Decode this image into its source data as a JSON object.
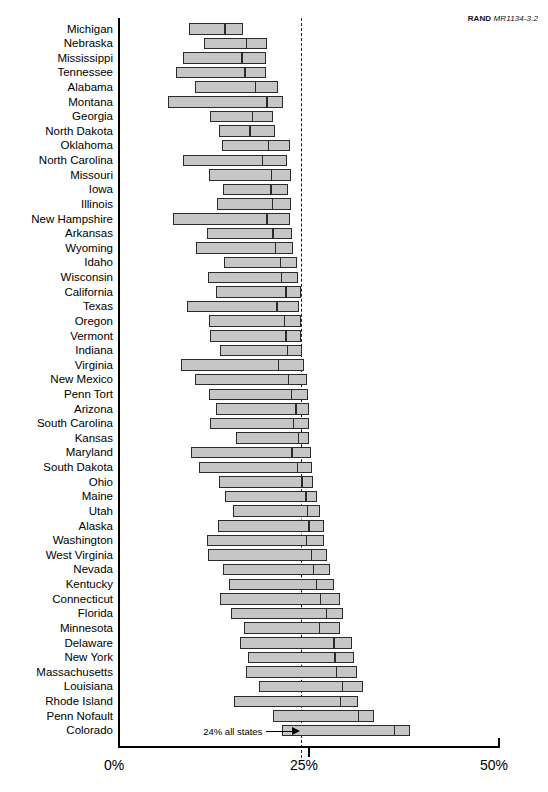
{
  "source_note": {
    "brand": "RAND",
    "report_id": "MR1134-3.2"
  },
  "annotation": {
    "label": "24% all states",
    "value": 24,
    "arrow_icon": "right-arrow-icon"
  },
  "axis": {
    "ticks": [
      "0%",
      "25%",
      "50%"
    ],
    "tick_values": [
      0,
      25,
      50
    ],
    "min": 0,
    "max": 50
  },
  "chart_data": {
    "type": "bar",
    "subtype": "floating-range-bar",
    "title": "",
    "subtitle": "",
    "xlabel": "",
    "ylabel": "",
    "xlim": [
      0,
      50
    ],
    "grid": false,
    "legend": null,
    "reference_line": {
      "value": 24,
      "label": "24% all states",
      "style": "dashed"
    },
    "note": "Each bar spans a low-to-high range; the internal divider marks the point estimate.",
    "categories": [
      "Michigan",
      "Nebraska",
      "Mississippi",
      "Tennessee",
      "Alabama",
      "Montana",
      "Georgia",
      "North Dakota",
      "Oklahoma",
      "North Carolina",
      "Missouri",
      "Iowa",
      "Illinois",
      "New Hampshire",
      "Arkansas",
      "Wyoming",
      "Idaho",
      "Wisconsin",
      "California",
      "Texas",
      "Oregon",
      "Vermont",
      "Indiana",
      "Virginia",
      "New Mexico",
      "Penn Tort",
      "Arizona",
      "South Carolina",
      "Kansas",
      "Maryland",
      "South Dakota",
      "Ohio",
      "Maine",
      "Utah",
      "Alaska",
      "Washington",
      "West Virginia",
      "Nevada",
      "Kentucky",
      "Connecticut",
      "Florida",
      "Minnesota",
      "Delaware",
      "New York",
      "Massachusetts",
      "Louisiana",
      "Rhode Island",
      "Penn Nofault",
      "Colorado"
    ],
    "series": [
      {
        "name": "low",
        "values": [
          9.3,
          11.2,
          8.5,
          7.6,
          10.1,
          6.5,
          12.1,
          13.2,
          13.6,
          8.5,
          11.9,
          13.8,
          13.0,
          7.2,
          11.6,
          10.2,
          13.9,
          11.8,
          12.8,
          9.0,
          11.9,
          12.0,
          13.4,
          8.3,
          10.1,
          11.9,
          12.8,
          12.1,
          15.4,
          9.5,
          10.6,
          13.2,
          14.0,
          15.0,
          13.1,
          11.6,
          11.8,
          13.8,
          14.5,
          13.3,
          14.8,
          16.5,
          16.0,
          17.0,
          16.7,
          18.5,
          15.2,
          20.3,
          21.5
        ]
      },
      {
        "name": "point",
        "values": [
          14.0,
          16.8,
          16.2,
          16.6,
          18.0,
          19.5,
          17.6,
          17.3,
          19.7,
          18.9,
          20.1,
          20.0,
          20.2,
          19.5,
          20.3,
          20.6,
          21.3,
          21.4,
          22.0,
          20.8,
          21.8,
          22.0,
          22.2,
          21.0,
          22.3,
          22.7,
          23.3,
          23.0,
          23.6,
          22.8,
          23.5,
          24.1,
          24.6,
          24.8,
          25.0,
          24.7,
          25.3,
          25.6,
          26.0,
          26.5,
          27.3,
          26.4,
          28.3,
          28.4,
          28.6,
          29.4,
          29.1,
          31.5,
          36.2
        ]
      },
      {
        "name": "high",
        "values": [
          16.4,
          19.5,
          19.4,
          19.4,
          20.9,
          21.6,
          20.3,
          20.6,
          22.5,
          22.1,
          22.7,
          22.2,
          22.6,
          22.5,
          22.8,
          22.9,
          23.4,
          23.6,
          24.0,
          23.7,
          23.9,
          24.0,
          24.1,
          24.4,
          24.8,
          24.9,
          25.0,
          25.0,
          25.0,
          25.3,
          25.4,
          25.5,
          26.0,
          26.4,
          26.9,
          27.0,
          27.4,
          27.8,
          28.3,
          29.1,
          29.4,
          29.0,
          30.6,
          30.9,
          31.3,
          32.1,
          31.4,
          33.5,
          38.2
        ]
      }
    ]
  },
  "colors": {
    "bar_fill": "#c6c6c6",
    "bar_stroke": "#2b2b2b",
    "axis": "#000000",
    "reference_line": "#1a1a1a",
    "background": "#ffffff"
  }
}
